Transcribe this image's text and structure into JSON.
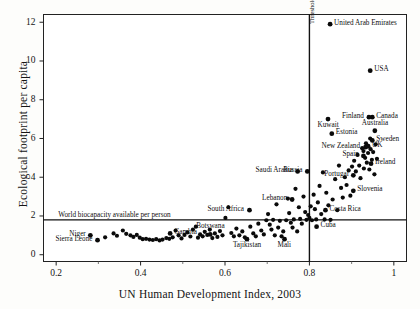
{
  "chart_data": {
    "type": "scatter",
    "title": "",
    "xlabel": "UN Human Development Index, 2003",
    "ylabel": "Ecological footprint per capita",
    "xlim": [
      0.17,
      1.03
    ],
    "ylim": [
      -0.35,
      12.4
    ],
    "grid": false,
    "legend": "none",
    "xticks": [
      "0.2",
      "0.4",
      "0.6",
      "0.8",
      "1"
    ],
    "xtick_values": [
      0.2,
      0.4,
      0.6,
      0.8,
      1.0
    ],
    "yticks": [
      "0",
      "2",
      "4",
      "6",
      "8",
      "10",
      "12"
    ],
    "ytick_values": [
      0,
      2,
      4,
      6,
      8,
      10,
      12
    ],
    "annotations": [
      {
        "name": "biocapacity-line",
        "text": "World biocapacity available per person",
        "kind": "horizontal-line",
        "y": 1.8,
        "label_x": 0.205,
        "label_y": 2.05
      },
      {
        "name": "hdi-threshold-line",
        "text": "Threshold for high human development",
        "kind": "vertical-line",
        "x": 0.8,
        "label_y": 11.9
      }
    ],
    "points": [
      {
        "label": "United Arab Emirates",
        "x": 0.849,
        "y": 11.9,
        "side": "right"
      },
      {
        "label": "USA",
        "x": 0.944,
        "y": 9.5,
        "side": "right"
      },
      {
        "label": "Canada",
        "x": 0.949,
        "y": 7.1,
        "side": "right"
      },
      {
        "label": "Finland",
        "x": 0.941,
        "y": 7.1,
        "side": "left"
      },
      {
        "label": "Kuwait",
        "x": 0.844,
        "y": 7.0,
        "side": "below"
      },
      {
        "label": "Australia",
        "x": 0.955,
        "y": 6.4,
        "side": "above"
      },
      {
        "label": "Estonia",
        "x": 0.853,
        "y": 6.25,
        "side": "right"
      },
      {
        "label": "Sweden",
        "x": 0.949,
        "y": 5.9,
        "side": "right"
      },
      {
        "label": "New Zealand",
        "x": 0.933,
        "y": 5.55,
        "side": "left"
      },
      {
        "label": "UK",
        "x": 0.939,
        "y": 5.6,
        "side": "right"
      },
      {
        "label": "Spain",
        "x": 0.928,
        "y": 5.1,
        "side": "left"
      },
      {
        "label": "Ireland",
        "x": 0.946,
        "y": 4.7,
        "side": "right"
      },
      {
        "label": "Russia",
        "x": 0.795,
        "y": 4.3,
        "side": "left"
      },
      {
        "label": "Portugal",
        "x": 0.904,
        "y": 4.1,
        "side": "left"
      },
      {
        "label": "Slovenia",
        "x": 0.904,
        "y": 3.3,
        "side": "right"
      },
      {
        "label": "Saudi Arabia",
        "x": 0.772,
        "y": 4.3,
        "side": "left"
      },
      {
        "label": "Lebanon",
        "x": 0.759,
        "y": 2.85,
        "side": "left"
      },
      {
        "label": "South Africa",
        "x": 0.658,
        "y": 2.3,
        "side": "left"
      },
      {
        "label": "Costa Rica",
        "x": 0.838,
        "y": 2.3,
        "side": "right"
      },
      {
        "label": "Cuba",
        "x": 0.817,
        "y": 1.45,
        "side": "right"
      },
      {
        "label": "Gambia",
        "x": 0.47,
        "y": 1.1,
        "side": "right"
      },
      {
        "label": "Botswana",
        "x": 0.565,
        "y": 1.05,
        "side": "above"
      },
      {
        "label": "Tajikistan",
        "x": 0.652,
        "y": 0.8,
        "side": "below"
      },
      {
        "label": "Mali",
        "x": 0.741,
        "y": 0.8,
        "side": "below"
      },
      {
        "label": "Niger",
        "x": 0.281,
        "y": 1.0,
        "side": "left"
      },
      {
        "label": "Sierra Leone",
        "x": 0.298,
        "y": 0.75,
        "side": "left"
      }
    ],
    "unlabeled_points": [
      {
        "x": 0.316,
        "y": 0.9
      },
      {
        "x": 0.336,
        "y": 1.1
      },
      {
        "x": 0.344,
        "y": 0.98
      },
      {
        "x": 0.358,
        "y": 1.25
      },
      {
        "x": 0.366,
        "y": 1.08
      },
      {
        "x": 0.376,
        "y": 1.0
      },
      {
        "x": 0.383,
        "y": 0.92
      },
      {
        "x": 0.391,
        "y": 1.02
      },
      {
        "x": 0.398,
        "y": 0.88
      },
      {
        "x": 0.405,
        "y": 0.8
      },
      {
        "x": 0.413,
        "y": 0.82
      },
      {
        "x": 0.421,
        "y": 0.78
      },
      {
        "x": 0.429,
        "y": 0.76
      },
      {
        "x": 0.437,
        "y": 0.8
      },
      {
        "x": 0.445,
        "y": 0.74
      },
      {
        "x": 0.452,
        "y": 0.78
      },
      {
        "x": 0.461,
        "y": 0.86
      },
      {
        "x": 0.468,
        "y": 0.82
      },
      {
        "x": 0.476,
        "y": 0.9
      },
      {
        "x": 0.483,
        "y": 1.25
      },
      {
        "x": 0.49,
        "y": 1.0
      },
      {
        "x": 0.497,
        "y": 0.84
      },
      {
        "x": 0.504,
        "y": 1.02
      },
      {
        "x": 0.511,
        "y": 1.15
      },
      {
        "x": 0.518,
        "y": 0.94
      },
      {
        "x": 0.524,
        "y": 1.3
      },
      {
        "x": 0.531,
        "y": 1.45
      },
      {
        "x": 0.536,
        "y": 0.88
      },
      {
        "x": 0.541,
        "y": 1.05
      },
      {
        "x": 0.547,
        "y": 0.95
      },
      {
        "x": 0.552,
        "y": 1.18
      },
      {
        "x": 0.558,
        "y": 1.02
      },
      {
        "x": 0.564,
        "y": 1.3
      },
      {
        "x": 0.57,
        "y": 0.86
      },
      {
        "x": 0.576,
        "y": 1.1
      },
      {
        "x": 0.582,
        "y": 0.92
      },
      {
        "x": 0.588,
        "y": 1.22
      },
      {
        "x": 0.594,
        "y": 1.0
      },
      {
        "x": 0.601,
        "y": 1.9
      },
      {
        "x": 0.608,
        "y": 2.45
      },
      {
        "x": 0.615,
        "y": 1.12
      },
      {
        "x": 0.621,
        "y": 0.95
      },
      {
        "x": 0.627,
        "y": 1.35
      },
      {
        "x": 0.634,
        "y": 1.0
      },
      {
        "x": 0.641,
        "y": 1.2
      },
      {
        "x": 0.647,
        "y": 0.9
      },
      {
        "x": 0.66,
        "y": 1.45
      },
      {
        "x": 0.667,
        "y": 1.1
      },
      {
        "x": 0.673,
        "y": 0.95
      },
      {
        "x": 0.679,
        "y": 1.6
      },
      {
        "x": 0.686,
        "y": 1.25
      },
      {
        "x": 0.692,
        "y": 1.05
      },
      {
        "x": 0.698,
        "y": 1.78
      },
      {
        "x": 0.702,
        "y": 2.1
      },
      {
        "x": 0.706,
        "y": 1.55
      },
      {
        "x": 0.71,
        "y": 1.3
      },
      {
        "x": 0.714,
        "y": 1.8
      },
      {
        "x": 0.718,
        "y": 1.0
      },
      {
        "x": 0.722,
        "y": 2.6
      },
      {
        "x": 0.726,
        "y": 1.4
      },
      {
        "x": 0.73,
        "y": 1.75
      },
      {
        "x": 0.734,
        "y": 0.95
      },
      {
        "x": 0.738,
        "y": 1.2
      },
      {
        "x": 0.745,
        "y": 1.78
      },
      {
        "x": 0.749,
        "y": 2.9
      },
      {
        "x": 0.752,
        "y": 2.15
      },
      {
        "x": 0.756,
        "y": 1.65
      },
      {
        "x": 0.76,
        "y": 1.4
      },
      {
        "x": 0.763,
        "y": 1.82
      },
      {
        "x": 0.767,
        "y": 3.4
      },
      {
        "x": 0.771,
        "y": 1.2
      },
      {
        "x": 0.775,
        "y": 2.45
      },
      {
        "x": 0.778,
        "y": 1.85
      },
      {
        "x": 0.782,
        "y": 1.6
      },
      {
        "x": 0.786,
        "y": 3.0
      },
      {
        "x": 0.79,
        "y": 2.2
      },
      {
        "x": 0.793,
        "y": 1.8
      },
      {
        "x": 0.797,
        "y": 2.05
      },
      {
        "x": 0.8,
        "y": 1.9
      },
      {
        "x": 0.803,
        "y": 2.5
      },
      {
        "x": 0.806,
        "y": 1.78
      },
      {
        "x": 0.81,
        "y": 3.1
      },
      {
        "x": 0.813,
        "y": 2.35
      },
      {
        "x": 0.816,
        "y": 1.82
      },
      {
        "x": 0.82,
        "y": 2.7
      },
      {
        "x": 0.824,
        "y": 3.55
      },
      {
        "x": 0.828,
        "y": 2.1
      },
      {
        "x": 0.832,
        "y": 4.25
      },
      {
        "x": 0.836,
        "y": 1.82
      },
      {
        "x": 0.84,
        "y": 3.2
      },
      {
        "x": 0.845,
        "y": 2.55
      },
      {
        "x": 0.85,
        "y": 1.8
      },
      {
        "x": 0.855,
        "y": 2.85
      },
      {
        "x": 0.861,
        "y": 3.9
      },
      {
        "x": 0.866,
        "y": 2.3
      },
      {
        "x": 0.87,
        "y": 4.6
      },
      {
        "x": 0.875,
        "y": 3.45
      },
      {
        "x": 0.879,
        "y": 2.95
      },
      {
        "x": 0.884,
        "y": 4.0
      },
      {
        "x": 0.888,
        "y": 3.6
      },
      {
        "x": 0.893,
        "y": 4.35
      },
      {
        "x": 0.897,
        "y": 3.05
      },
      {
        "x": 0.901,
        "y": 4.55
      },
      {
        "x": 0.906,
        "y": 4.85
      },
      {
        "x": 0.91,
        "y": 4.3
      },
      {
        "x": 0.914,
        "y": 5.15
      },
      {
        "x": 0.918,
        "y": 4.6
      },
      {
        "x": 0.921,
        "y": 3.95
      },
      {
        "x": 0.925,
        "y": 5.5
      },
      {
        "x": 0.929,
        "y": 4.45
      },
      {
        "x": 0.932,
        "y": 5.0
      },
      {
        "x": 0.936,
        "y": 4.75
      },
      {
        "x": 0.939,
        "y": 5.25
      },
      {
        "x": 0.942,
        "y": 4.4
      },
      {
        "x": 0.945,
        "y": 5.45
      },
      {
        "x": 0.948,
        "y": 4.9
      },
      {
        "x": 0.951,
        "y": 5.3
      },
      {
        "x": 0.954,
        "y": 4.15
      },
      {
        "x": 0.957,
        "y": 5.7
      },
      {
        "x": 0.96,
        "y": 4.95
      },
      {
        "x": 0.934,
        "y": 5.75
      },
      {
        "x": 0.928,
        "y": 5.35
      },
      {
        "x": 0.944,
        "y": 6.0
      }
    ]
  }
}
